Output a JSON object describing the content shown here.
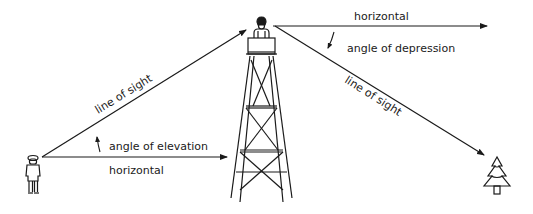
{
  "diagram": {
    "type": "angles of elevation and depression",
    "labels": {
      "line_of_sight_left": "line of sight",
      "angle_of_elevation": "angle of elevation",
      "horizontal_bottom": "horizontal",
      "horizontal_top": "horizontal",
      "angle_of_depression": "angle of depression",
      "line_of_sight_right": "line of sight"
    },
    "figures": {
      "observer_ground": "person-icon",
      "observer_tower": "person-icon",
      "tower": "lookout-tower-icon",
      "target": "tree-icon"
    },
    "colors": {
      "stroke": "#1a1a1a",
      "background": "#ffffff"
    }
  }
}
